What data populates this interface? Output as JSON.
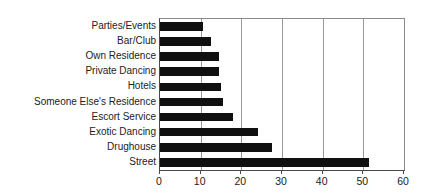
{
  "chart_data": {
    "type": "bar",
    "orientation": "horizontal",
    "title": "",
    "subtitle": "",
    "xlabel": "",
    "ylabel": "",
    "xlim": [
      0,
      60
    ],
    "xticks": [
      0,
      10,
      20,
      30,
      40,
      50,
      60
    ],
    "grid": true,
    "gridlines_axis": "x",
    "legend": false,
    "legend_position": "none",
    "bar_color": "#101010",
    "categories": [
      "Parties/Events",
      "Bar/Club",
      "Own Residence",
      "Private Dancing",
      "Hotels",
      "Someone Else's Residence",
      "Escort Service",
      "Exotic Dancing",
      "Drughouse",
      "Street"
    ],
    "values": [
      10.5,
      12.5,
      14.5,
      14.5,
      15,
      15.5,
      18,
      24,
      27.5,
      51.5
    ]
  },
  "axis": {
    "tick_labels": [
      "0",
      "10",
      "20",
      "30",
      "40",
      "50",
      "60"
    ]
  }
}
